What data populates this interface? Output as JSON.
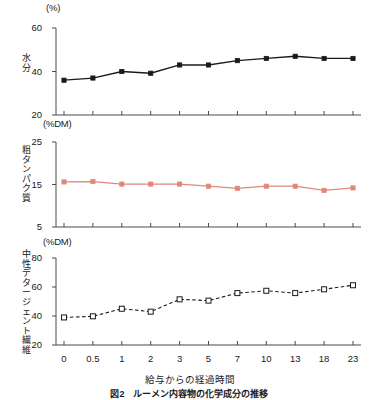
{
  "figure": {
    "caption": "図2　ルーメン内容物の化学成分の推移",
    "xaxis_title": "給与からの経過時間",
    "x_categories": [
      "0",
      "0.5",
      "1",
      "2",
      "3",
      "5",
      "7",
      "10",
      "13",
      "18",
      "23"
    ]
  },
  "chart_data": [
    {
      "type": "line",
      "panel_index": 0,
      "title": "水分",
      "ylabel": "水分",
      "unit": "(%)",
      "xlabel": "給与からの経過時間",
      "categories": [
        "0",
        "0.5",
        "1",
        "2",
        "3",
        "5",
        "7",
        "10",
        "13",
        "18",
        "23"
      ],
      "values": [
        36.0,
        37.0,
        40.0,
        39.2,
        43.0,
        43.0,
        45.0,
        46.0,
        47.0,
        46.0,
        46.0
      ],
      "ylim": [
        20,
        60
      ],
      "yticks": [
        20,
        40,
        60
      ],
      "grid": false,
      "marker": "filled-square",
      "line_style": "solid",
      "color": "#1a1a1a"
    },
    {
      "type": "line",
      "panel_index": 1,
      "title": "粗タンパク質",
      "ylabel": "粗タンパク質",
      "unit": "(%DM)",
      "xlabel": "給与からの経過時間",
      "categories": [
        "0",
        "0.5",
        "1",
        "2",
        "3",
        "5",
        "7",
        "10",
        "13",
        "18",
        "23"
      ],
      "values": [
        15.6,
        15.7,
        15.1,
        15.1,
        15.1,
        14.6,
        14.1,
        14.6,
        14.6,
        13.6,
        14.2
      ],
      "ylim": [
        5,
        25
      ],
      "yticks": [
        5,
        15,
        25
      ],
      "grid": false,
      "marker": "filled-square",
      "line_style": "solid",
      "color": "#e08878"
    },
    {
      "type": "line",
      "panel_index": 2,
      "title": "中性デタージェント繊維",
      "ylabel": "中性デタージェント繊維",
      "unit": "(%DM)",
      "xlabel": "給与からの経過時間",
      "categories": [
        "0",
        "0.5",
        "1",
        "2",
        "3",
        "5",
        "7",
        "10",
        "13",
        "18",
        "23"
      ],
      "values": [
        39.0,
        39.8,
        45.0,
        43.0,
        51.5,
        50.6,
        55.8,
        57.4,
        55.8,
        58.4,
        61.2
      ],
      "ylim": [
        20,
        80
      ],
      "yticks": [
        20,
        40,
        60,
        80
      ],
      "grid": false,
      "marker": "open-square",
      "line_style": "dashed",
      "color": "#1a1a1a"
    }
  ],
  "colors": {
    "axis": "#4a4a4a",
    "series_moisture": "#1a1a1a",
    "series_protein": "#e08878",
    "series_ndf": "#1a1a1a",
    "background": "#ffffff"
  }
}
